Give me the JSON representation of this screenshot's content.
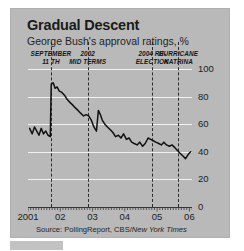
{
  "title": "Gradual Descent",
  "subtitle": "George Bush's approval ratings, %",
  "source": "Source: PollingReport, CBS/New York Times",
  "source_prefix": "Source: PollingReport, CBS/",
  "source_italic": "New York Times",
  "colors": {
    "panel": "#b9b9b9",
    "line": "#111111",
    "gridline": "#f2f2f2",
    "axis": "#3a3a3a",
    "event_line": "#2b2b2b",
    "text": "#1a1a1a",
    "page_background": "#ffffff"
  },
  "events": [
    {
      "id": "september-11",
      "line1": "SEPTEMBER",
      "line2": "11 TH",
      "x": 2001.71
    },
    {
      "id": "mid-terms-2002",
      "line1": "2002",
      "line2": "MID TERMS",
      "x": 2002.85
    },
    {
      "id": "re-election-2004",
      "line1": "2004 RE-",
      "line2": "ELECTION",
      "x": 2004.85
    },
    {
      "id": "hurricane-katrina",
      "line1": "HURRICANE",
      "line2": "KATRINA",
      "x": 2005.66
    }
  ],
  "chart_data": {
    "type": "line",
    "title": "Gradual Descent",
    "subtitle": "George Bush's approval ratings, %",
    "xlabel": "",
    "ylabel": "%",
    "xlim": [
      2001.0,
      2006.08
    ],
    "ylim": [
      0,
      100
    ],
    "ytick_labels": [
      "0",
      "20",
      "40",
      "60",
      "80",
      "100"
    ],
    "yticks": [
      0,
      20,
      40,
      60,
      80,
      100
    ],
    "xtick_labels": [
      "2001",
      "02",
      "03",
      "04",
      "05",
      "06"
    ],
    "xticks": [
      2001,
      2002,
      2003,
      2004,
      2005,
      2006
    ],
    "grid": "horizontal",
    "legend": "none",
    "series": [
      {
        "name": "George Bush approval rating",
        "x": [
          2001.05,
          2001.13,
          2001.2,
          2001.27,
          2001.34,
          2001.41,
          2001.48,
          2001.55,
          2001.62,
          2001.69,
          2001.72,
          2001.78,
          2001.84,
          2001.9,
          2001.97,
          2002.05,
          2002.13,
          2002.21,
          2002.29,
          2002.38,
          2002.46,
          2002.55,
          2002.63,
          2002.72,
          2002.8,
          2002.88,
          2002.96,
          2003.04,
          2003.12,
          2003.18,
          2003.24,
          2003.3,
          2003.38,
          2003.46,
          2003.55,
          2003.63,
          2003.71,
          2003.8,
          2003.88,
          2003.96,
          2004.05,
          2004.13,
          2004.21,
          2004.29,
          2004.38,
          2004.46,
          2004.55,
          2004.63,
          2004.72,
          2004.8,
          2004.88,
          2004.96,
          2005.05,
          2005.13,
          2005.21,
          2005.29,
          2005.38,
          2005.46,
          2005.55,
          2005.63,
          2005.71,
          2005.8,
          2005.88,
          2005.96,
          2006.04
        ],
        "y": [
          57,
          53,
          58,
          55,
          52,
          57,
          53,
          55,
          52,
          51,
          89,
          90,
          86,
          87,
          84,
          83,
          81,
          78,
          76,
          74,
          72,
          70,
          68,
          66,
          67,
          66,
          63,
          58,
          55,
          70,
          67,
          63,
          60,
          58,
          56,
          54,
          51,
          52,
          50,
          53,
          49,
          50,
          47,
          46,
          45,
          47,
          44,
          46,
          50,
          49,
          48,
          47,
          46,
          45,
          47,
          45,
          44,
          45,
          43,
          41,
          39,
          37,
          35,
          38,
          40
        ]
      }
    ],
    "annotations": [
      {
        "label": "SEPTEMBER 11 TH",
        "x": 2001.71,
        "type": "vertical-dashed-line"
      },
      {
        "label": "2002 MID TERMS",
        "x": 2002.85,
        "type": "vertical-dashed-line"
      },
      {
        "label": "2004 RE-ELECTION",
        "x": 2004.85,
        "type": "vertical-dashed-line"
      },
      {
        "label": "HURRICANE KATRINA",
        "x": 2005.66,
        "type": "vertical-dashed-line"
      }
    ]
  }
}
